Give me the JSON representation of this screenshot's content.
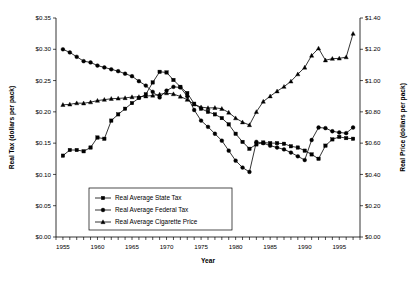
{
  "chart_data": {
    "type": "line",
    "title": "",
    "xlabel": "Year",
    "ylabel": "Real Tax (dollars per pack)",
    "y2label": "Real Price (dollars per pack)",
    "xlim": [
      1954,
      1998
    ],
    "ylim": [
      0.0,
      0.35
    ],
    "y2lim": [
      0.0,
      1.4
    ],
    "grid": false,
    "legend_position": "lower-center-left",
    "x_tick_labels": [
      "1955",
      "1960",
      "1965",
      "1970",
      "1975",
      "1980",
      "1985",
      "1990",
      "1995"
    ],
    "x_tick_values": [
      1955,
      1960,
      1965,
      1970,
      1975,
      1980,
      1985,
      1990,
      1995
    ],
    "x_minor_tick_step": 1,
    "y_tick_labels": [
      "$0.00",
      "$0.05",
      "$0.10",
      "$0.15",
      "$0.20",
      "$0.25",
      "$0.30",
      "$0.35"
    ],
    "y_tick_values": [
      0.0,
      0.05,
      0.1,
      0.15,
      0.2,
      0.25,
      0.3,
      0.35
    ],
    "y2_tick_labels": [
      "$0.00",
      "$0.20",
      "$0.40",
      "$0.60",
      "$0.80",
      "$1.00",
      "$1.20",
      "$1.40"
    ],
    "y2_tick_values": [
      0.0,
      0.2,
      0.4,
      0.6,
      0.8,
      1.0,
      1.2,
      1.4
    ],
    "x": [
      1955,
      1956,
      1957,
      1958,
      1959,
      1960,
      1961,
      1962,
      1963,
      1964,
      1965,
      1966,
      1967,
      1968,
      1969,
      1970,
      1971,
      1972,
      1973,
      1974,
      1975,
      1976,
      1977,
      1978,
      1979,
      1980,
      1981,
      1982,
      1983,
      1984,
      1985,
      1986,
      1987,
      1988,
      1989,
      1990,
      1991,
      1992,
      1993,
      1994,
      1995,
      1996,
      1997
    ],
    "series": [
      {
        "name": "Real Average State Tax",
        "axis": "left",
        "marker": "square",
        "values": [
          0.13,
          0.139,
          0.139,
          0.137,
          0.143,
          0.159,
          0.157,
          0.186,
          0.196,
          0.205,
          0.214,
          0.222,
          0.228,
          0.247,
          0.264,
          0.263,
          0.251,
          0.24,
          0.23,
          0.213,
          0.205,
          0.2,
          0.196,
          0.19,
          0.18,
          0.165,
          0.152,
          0.141,
          0.148,
          0.151,
          0.15,
          0.15,
          0.149,
          0.145,
          0.143,
          0.138,
          0.132,
          0.125,
          0.146,
          0.156,
          0.16,
          0.158,
          0.157
        ]
      },
      {
        "name": "Real Average Federal Tax",
        "axis": "left",
        "marker": "circle",
        "values": [
          0.3,
          0.295,
          0.288,
          0.281,
          0.279,
          0.274,
          0.271,
          0.268,
          0.265,
          0.261,
          0.257,
          0.249,
          0.242,
          0.232,
          0.223,
          0.234,
          0.24,
          0.239,
          0.225,
          0.203,
          0.186,
          0.176,
          0.165,
          0.154,
          0.138,
          0.122,
          0.111,
          0.104,
          0.152,
          0.15,
          0.146,
          0.143,
          0.14,
          0.135,
          0.129,
          0.123,
          0.155,
          0.175,
          0.174,
          0.169,
          0.167,
          0.166,
          0.175
        ]
      },
      {
        "name": "Real Average Cigarette Price",
        "axis": "right",
        "marker": "triangle",
        "values": [
          0.845,
          0.848,
          0.856,
          0.855,
          0.862,
          0.872,
          0.878,
          0.884,
          0.886,
          0.889,
          0.895,
          0.896,
          0.9,
          0.905,
          0.912,
          0.92,
          0.914,
          0.898,
          0.878,
          0.848,
          0.83,
          0.825,
          0.826,
          0.82,
          0.796,
          0.76,
          0.734,
          0.716,
          0.8,
          0.866,
          0.9,
          0.932,
          0.961,
          0.995,
          1.041,
          1.084,
          1.16,
          1.206,
          1.13,
          1.14,
          1.142,
          1.15,
          1.3
        ]
      }
    ]
  },
  "legend": {
    "items": [
      {
        "label": "Real Average State Tax",
        "marker": "square"
      },
      {
        "label": "Real Average Federal Tax",
        "marker": "circle"
      },
      {
        "label": "Real Average Cigarette Price",
        "marker": "triangle"
      }
    ]
  }
}
